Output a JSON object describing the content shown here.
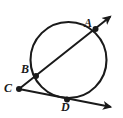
{
  "figure": {
    "kind": "circle-secant-diagram",
    "width": 123,
    "height": 118,
    "background_color": "#ffffff",
    "stroke_color": "#1a1a1a",
    "label_color": "#1a1a1a"
  },
  "circle": {
    "name": "circle-outline",
    "cx": 68.5,
    "cy": 60,
    "r": 38,
    "stroke_width": 2.1,
    "fill": "none"
  },
  "points": [
    {
      "id": "A",
      "label": "A",
      "x": 95.5,
      "y": 29.0,
      "on_circle": true,
      "dot_r": 3.0
    },
    {
      "id": "B",
      "label": "B",
      "x": 36.0,
      "y": 76.0,
      "on_circle": true,
      "dot_r": 3.0
    },
    {
      "id": "C",
      "label": "C",
      "x": 19.0,
      "y": 89.0,
      "on_circle": false,
      "dot_r": 3.0
    },
    {
      "id": "D",
      "label": "D",
      "x": 67.0,
      "y": 99.5,
      "on_circle": true,
      "dot_r": 3.0
    }
  ],
  "rays": [
    {
      "id": "ray-CBA",
      "from": "C",
      "through": [
        "B",
        "A"
      ],
      "start": {
        "x": 19.0,
        "y": 89.0
      },
      "end": {
        "x": 113.0,
        "y": 14.5
      },
      "arrow_at_end": true,
      "stroke_width": 2.0
    },
    {
      "id": "ray-CD",
      "from": "C",
      "through": [
        "D"
      ],
      "start": {
        "x": 19.0,
        "y": 89.0
      },
      "end": {
        "x": 114.0,
        "y": 107.5
      },
      "arrow_at_end": true,
      "stroke_width": 2.0
    }
  ],
  "labels": {
    "A": "A",
    "B": "B",
    "C": "C",
    "D": "D"
  }
}
